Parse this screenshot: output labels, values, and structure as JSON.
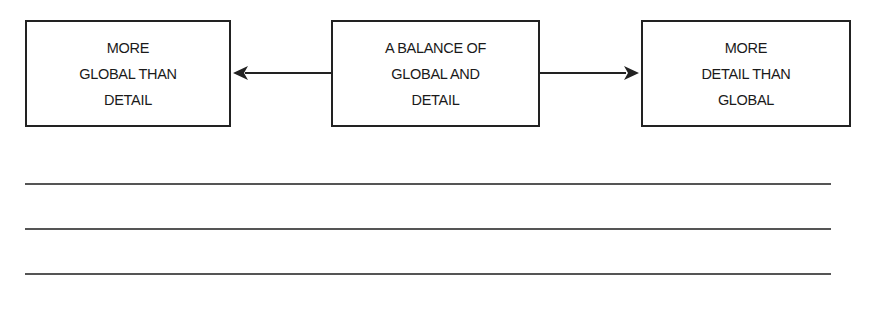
{
  "diagram": {
    "type": "spectrum",
    "nodes": [
      {
        "id": "left",
        "label": "MORE\nGLOBAL THAN\nDETAIL"
      },
      {
        "id": "center",
        "label": "A BALANCE OF\nGLOBAL AND\nDETAIL"
      },
      {
        "id": "right",
        "label": "MORE\nDETAIL THAN\nGLOBAL"
      }
    ],
    "edges": [
      {
        "from": "center",
        "to": "left",
        "style": "arrow"
      },
      {
        "from": "center",
        "to": "right",
        "style": "arrow"
      }
    ],
    "colors": {
      "stroke": "#222222",
      "answer_lines": "#555555",
      "background": "#ffffff"
    }
  },
  "answer_lines": {
    "count": 3,
    "values": [
      "",
      "",
      ""
    ]
  }
}
